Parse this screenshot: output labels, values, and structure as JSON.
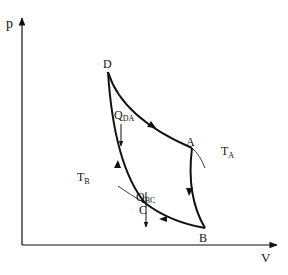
{
  "diagram": {
    "type": "p-V thermodynamic cycle (Carnot-like)",
    "axes": {
      "y_label": "p",
      "x_label": "V"
    },
    "points": {
      "A": "A",
      "B": "B",
      "C": "C",
      "D": "D"
    },
    "isotherms": {
      "upper": {
        "label_main": "T",
        "label_sub": "A"
      },
      "lower": {
        "label_main": "T",
        "label_sub": "B"
      }
    },
    "heat_flows": {
      "DA": {
        "label_main": "Q",
        "label_sub": "DA",
        "direction": "down"
      },
      "BC": {
        "label_main": "Q",
        "label_sub": "BC",
        "direction": "down"
      }
    },
    "path_order": [
      "D",
      "A",
      "B",
      "C",
      "D"
    ],
    "colors": {
      "stroke": "#111111",
      "background": "#ffffff"
    }
  }
}
